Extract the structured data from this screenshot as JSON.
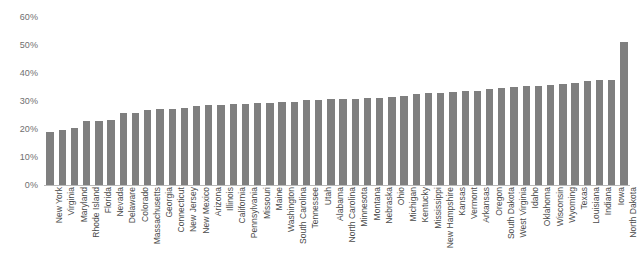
{
  "chart_data": {
    "type": "bar",
    "title": "",
    "subtitle": "",
    "xlabel": "",
    "ylabel": "",
    "ylim": [
      0,
      60
    ],
    "y_unit": "%",
    "y_ticks": [
      0,
      10,
      20,
      30,
      40,
      50,
      60
    ],
    "y_tick_labels": [
      "0%",
      "10%",
      "20%",
      "30%",
      "40%",
      "50%",
      "60%"
    ],
    "grid": false,
    "legend": false,
    "bar_color": "#7f7f7f",
    "categories": [
      "New York",
      "Virginia",
      "Maryland",
      "Rhode Island",
      "Florida",
      "Nevada",
      "Delaware",
      "Colorado",
      "Massachusetts",
      "Georgia",
      "Connecticut",
      "New Jersey",
      "New Mexico",
      "Arizona",
      "Illinois",
      "California",
      "Pennsylvania",
      "Missouri",
      "Maine",
      "Washington",
      "South Carolina",
      "Tennessee",
      "Utah",
      "Alabama",
      "North Carolina",
      "Minnesota",
      "Montana",
      "Nebraska",
      "Ohio",
      "Michigan",
      "Kentucky",
      "Mississippi",
      "New Hampshire",
      "Kansas",
      "Vermont",
      "Arkansas",
      "Oregon",
      "South Dakota",
      "West Virginia",
      "Idaho",
      "Oklahoma",
      "Wisconsin",
      "Wyoming",
      "Texas",
      "Louisiana",
      "Indiana",
      "Iowa",
      "North Dakota"
    ],
    "values": [
      19.0,
      19.8,
      20.5,
      22.7,
      22.9,
      23.3,
      25.6,
      25.7,
      26.8,
      27.3,
      27.3,
      27.6,
      28.3,
      28.6,
      28.7,
      28.9,
      29.0,
      29.2,
      29.3,
      29.5,
      29.7,
      30.4,
      30.5,
      30.6,
      30.6,
      30.7,
      30.9,
      31.0,
      31.4,
      31.9,
      32.4,
      32.7,
      33.0,
      33.2,
      33.4,
      33.6,
      34.4,
      34.7,
      35.1,
      35.2,
      35.4,
      35.7,
      36.2,
      36.3,
      37.3,
      37.5,
      37.6,
      51.0
    ]
  }
}
